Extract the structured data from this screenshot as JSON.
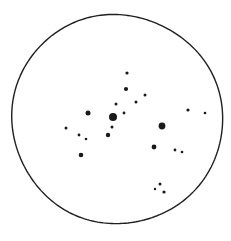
{
  "sketch": {
    "medium_label": "ink-on-white-paper",
    "background_color": "#ffffff",
    "ink_color": "#1a1a1a",
    "field_circle": {
      "name": "eyepiece-field-circle",
      "center_x": 117,
      "center_y": 119,
      "radius": 105,
      "stroke_width": 1.4,
      "stroke_color": "#1f1f1f",
      "fill": "none"
    }
  },
  "chart_data": {
    "type": "scatter",
    "title": "",
    "subtitle": "",
    "xlabel": "",
    "ylabel": "",
    "grid": false,
    "legend_position": "none",
    "axis_ranges": {
      "x": [
        0,
        231
      ],
      "y": [
        0,
        241
      ]
    },
    "coordinate_note": "pixel coordinates, y increases downward",
    "marker_shape": "filled-circle",
    "marker_color": "#1a1a1a",
    "series": [
      {
        "name": "Stars",
        "points": [
          {
            "id": "star-01",
            "x": 113,
            "y": 117,
            "r": 4.0,
            "mag_class": "brightest"
          },
          {
            "id": "star-02",
            "x": 162,
            "y": 126,
            "r": 3.4,
            "mag_class": "bright"
          },
          {
            "id": "star-03",
            "x": 88,
            "y": 113,
            "r": 2.5,
            "mag_class": "medium"
          },
          {
            "id": "star-04",
            "x": 81,
            "y": 155,
            "r": 2.3,
            "mag_class": "medium"
          },
          {
            "id": "star-05",
            "x": 154,
            "y": 147,
            "r": 2.4,
            "mag_class": "medium"
          },
          {
            "id": "star-06",
            "x": 126,
            "y": 89,
            "r": 2.1,
            "mag_class": "medium"
          },
          {
            "id": "star-07",
            "x": 108,
            "y": 135,
            "r": 2.2,
            "mag_class": "medium"
          },
          {
            "id": "star-08",
            "x": 136,
            "y": 102,
            "r": 1.5,
            "mag_class": "faint"
          },
          {
            "id": "star-09",
            "x": 124,
            "y": 113,
            "r": 1.4,
            "mag_class": "faint"
          },
          {
            "id": "star-10",
            "x": 116,
            "y": 104,
            "r": 1.5,
            "mag_class": "faint"
          },
          {
            "id": "star-11",
            "x": 127,
            "y": 73,
            "r": 1.6,
            "mag_class": "faint"
          },
          {
            "id": "star-12",
            "x": 145,
            "y": 95,
            "r": 1.5,
            "mag_class": "faint"
          },
          {
            "id": "star-13",
            "x": 112,
            "y": 127,
            "r": 1.5,
            "mag_class": "faint"
          },
          {
            "id": "star-14",
            "x": 66,
            "y": 128,
            "r": 1.5,
            "mag_class": "faint"
          },
          {
            "id": "star-15",
            "x": 79,
            "y": 135,
            "r": 1.4,
            "mag_class": "faint"
          },
          {
            "id": "star-16",
            "x": 86,
            "y": 139,
            "r": 1.3,
            "mag_class": "faint"
          },
          {
            "id": "star-17",
            "x": 188,
            "y": 110,
            "r": 1.6,
            "mag_class": "faint"
          },
          {
            "id": "star-18",
            "x": 205,
            "y": 113,
            "r": 1.3,
            "mag_class": "faint"
          },
          {
            "id": "star-19",
            "x": 175,
            "y": 150,
            "r": 1.4,
            "mag_class": "faint"
          },
          {
            "id": "star-20",
            "x": 182,
            "y": 152,
            "r": 1.3,
            "mag_class": "faint"
          },
          {
            "id": "star-21",
            "x": 160,
            "y": 184,
            "r": 1.5,
            "mag_class": "faint"
          },
          {
            "id": "star-22",
            "x": 164,
            "y": 192,
            "r": 1.6,
            "mag_class": "faint"
          },
          {
            "id": "star-23",
            "x": 155,
            "y": 189,
            "r": 1.2,
            "mag_class": "faint"
          }
        ]
      }
    ]
  }
}
